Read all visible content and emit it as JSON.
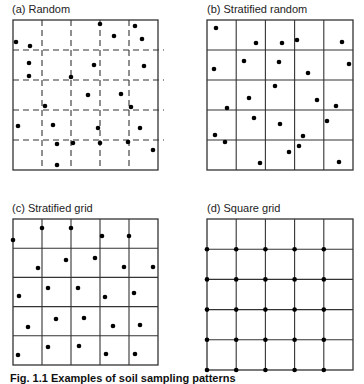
{
  "panels": [
    {
      "id": "a",
      "title": "(a)  Random",
      "grid": "dashed",
      "box": {
        "x": 13,
        "y": 20,
        "w": 145,
        "h": 150
      },
      "points": [
        [
          100,
          24
        ],
        [
          135,
          26
        ],
        [
          114,
          36
        ],
        [
          142,
          39
        ],
        [
          16,
          42
        ],
        [
          30,
          46
        ],
        [
          29,
          63
        ],
        [
          94,
          65
        ],
        [
          144,
          66
        ],
        [
          29,
          76
        ],
        [
          71,
          77
        ],
        [
          88,
          95
        ],
        [
          121,
          94
        ],
        [
          131,
          107
        ],
        [
          45,
          106
        ],
        [
          18,
          126
        ],
        [
          53,
          125
        ],
        [
          98,
          128
        ],
        [
          140,
          128
        ],
        [
          57,
          144
        ],
        [
          73,
          143
        ],
        [
          100,
          143
        ],
        [
          128,
          142
        ],
        [
          153,
          150
        ],
        [
          57,
          165
        ]
      ]
    },
    {
      "id": "b",
      "title": "(b)  Stratified random",
      "grid": "solid",
      "box": {
        "x": 207,
        "y": 20,
        "w": 146,
        "h": 150
      },
      "points": [
        [
          216,
          28
        ],
        [
          256,
          43
        ],
        [
          282,
          43
        ],
        [
          297,
          40
        ],
        [
          342,
          42
        ],
        [
          214,
          69
        ],
        [
          244,
          61
        ],
        [
          279,
          62
        ],
        [
          349,
          64
        ],
        [
          308,
          73
        ],
        [
          275,
          86
        ],
        [
          249,
          98
        ],
        [
          317,
          100
        ],
        [
          336,
          106
        ],
        [
          227,
          108
        ],
        [
          254,
          118
        ],
        [
          280,
          124
        ],
        [
          327,
          121
        ],
        [
          215,
          135
        ],
        [
          225,
          142
        ],
        [
          303,
          136
        ],
        [
          299,
          146
        ],
        [
          289,
          152
        ],
        [
          260,
          163
        ],
        [
          339,
          162
        ]
      ]
    },
    {
      "id": "c",
      "title": "(c)  Stratified grid",
      "grid": "solid",
      "box": {
        "x": 13,
        "y": 219,
        "w": 145,
        "h": 146
      },
      "points": [
        [
          13,
          240
        ],
        [
          42,
          228
        ],
        [
          71,
          228
        ],
        [
          102,
          236
        ],
        [
          129,
          236
        ],
        [
          38,
          268
        ],
        [
          66,
          260
        ],
        [
          95,
          258
        ],
        [
          124,
          267
        ],
        [
          153,
          267
        ],
        [
          19,
          296
        ],
        [
          48,
          288
        ],
        [
          78,
          288
        ],
        [
          105,
          297
        ],
        [
          134,
          293
        ],
        [
          28,
          327
        ],
        [
          56,
          319
        ],
        [
          84,
          318
        ],
        [
          113,
          326
        ],
        [
          140,
          325
        ],
        [
          18,
          355
        ],
        [
          48,
          347
        ],
        [
          79,
          346
        ],
        [
          106,
          354
        ],
        [
          135,
          354
        ]
      ]
    },
    {
      "id": "d",
      "title": "(d)  Square grid",
      "grid": "solid",
      "box": {
        "x": 207,
        "y": 219,
        "w": 146,
        "h": 151
      },
      "points": "grid-intersections"
    }
  ],
  "caption": "Fig. 1.1  Examples of soil sampling patterns"
}
